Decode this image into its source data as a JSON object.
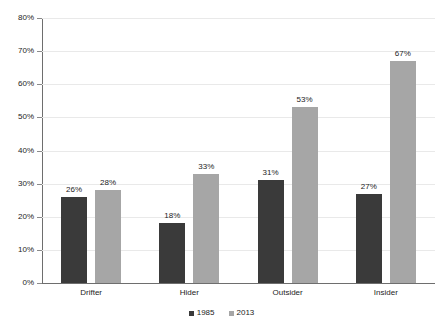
{
  "chart_data": {
    "type": "bar",
    "title": "",
    "subtitle": "",
    "xlabel": "",
    "ylabel": "",
    "categories": [
      "Drifter",
      "Hider",
      "Outsider",
      "Insider"
    ],
    "series": [
      {
        "name": "1985",
        "color": "#3a3a3a",
        "values": [
          26,
          18,
          31,
          27
        ],
        "labels": [
          "26%",
          "18%",
          "31%",
          "27%"
        ]
      },
      {
        "name": "2013",
        "color": "#a6a6a6",
        "values": [
          28,
          33,
          53,
          67
        ],
        "labels": [
          "28%",
          "33%",
          "53%",
          "67%"
        ]
      }
    ],
    "ylim": [
      0,
      80
    ],
    "ytick_values": [
      0,
      10,
      20,
      30,
      40,
      50,
      60,
      70,
      80
    ],
    "ytick_labels": [
      "0%",
      "10%",
      "20%",
      "30%",
      "40%",
      "50%",
      "60%",
      "70%",
      "80%"
    ],
    "grid": true,
    "grid_axis": "y",
    "legend_position": "bottom-center",
    "value_labels_shown": true,
    "colors": {
      "series_1985": "#3a3a3a",
      "series_2013": "#a6a6a6",
      "gridline": "#e9e9e9",
      "axis": "#6e6e6e",
      "background": "#ffffff",
      "text": "#1c1c1c"
    }
  }
}
